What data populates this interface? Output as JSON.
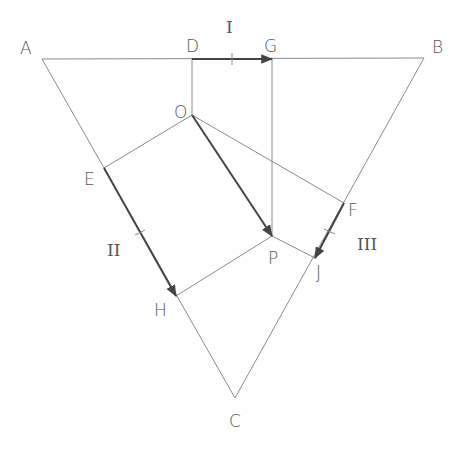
{
  "diagram": {
    "points": {
      "A": {
        "label": "A",
        "x": 42,
        "y": 59
      },
      "B": {
        "label": "B",
        "x": 424,
        "y": 58
      },
      "C": {
        "label": "C",
        "x": 235,
        "y": 398
      },
      "D": {
        "label": "D",
        "x": 192,
        "y": 59
      },
      "G": {
        "label": "G",
        "x": 272,
        "y": 59
      },
      "O": {
        "label": "O",
        "x": 192,
        "y": 115
      },
      "E": {
        "label": "E",
        "x": 104,
        "y": 168
      },
      "F": {
        "label": "F",
        "x": 344,
        "y": 203
      },
      "H": {
        "label": "H",
        "x": 176,
        "y": 296
      },
      "P": {
        "label": "P",
        "x": 272,
        "y": 236
      },
      "J": {
        "label": "J",
        "x": 315,
        "y": 258
      }
    },
    "vector_labels": {
      "I": "I",
      "II": "II",
      "III": "III"
    },
    "line_color": "#8a8a8a",
    "vector_color": "#444444",
    "text_color": "#555555"
  }
}
